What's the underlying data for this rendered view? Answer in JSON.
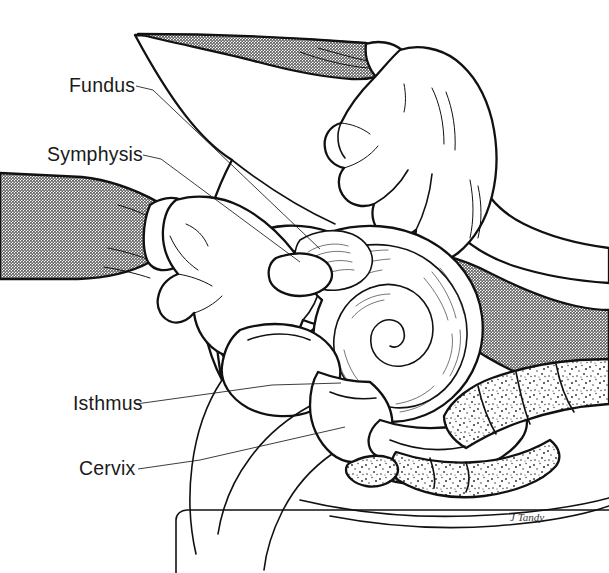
{
  "figure": {
    "domain": "medical-illustration",
    "background_color": "#ffffff",
    "ink_color": "#111111",
    "shade_color": "#8c8c8c",
    "width": 609,
    "height": 573
  },
  "labels": [
    {
      "id": "fundus",
      "text": "Fundus",
      "x": 69,
      "y": 92,
      "leader": "M 136 86 L 153 90 L 320 249"
    },
    {
      "id": "symphysis",
      "text": "Symphysis",
      "x": 47,
      "y": 161,
      "leader": "M 143 155 L 161 159 L 300 262"
    },
    {
      "id": "isthmus",
      "text": "Isthmus",
      "x": 73,
      "y": 410,
      "leader": "M 136 404 L 272 385 L 341 383"
    },
    {
      "id": "cervix",
      "text": "Cervix",
      "x": 79,
      "y": 475,
      "leader": "M 138 469 L 200 460 L 345 427"
    }
  ],
  "signature": {
    "text": "J Tandy",
    "x": 510,
    "y": 521
  },
  "anatomy_parts": [
    "abdominal-wall",
    "uterus-fundus",
    "uterine-cavity",
    "pubic-symphysis",
    "bladder",
    "isthmus",
    "cervix",
    "vagina",
    "rectum",
    "sacrum",
    "coccyx",
    "examination-table"
  ],
  "hands": [
    {
      "id": "abdominal-hand",
      "position": "upper-right",
      "role": "external-abdominal-palpation"
    },
    {
      "id": "vaginal-hand",
      "position": "left",
      "role": "internal-vaginal-examination"
    }
  ],
  "colors": {
    "ink": "#111111",
    "halftone_gray": "#8c8c8c",
    "halftone_dark_gray": "#6f6f6f",
    "paper": "#ffffff",
    "leader_line": "#1a1a1a"
  }
}
